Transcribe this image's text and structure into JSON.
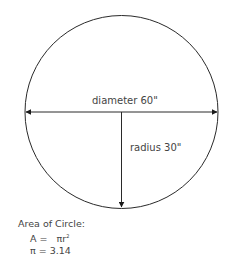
{
  "diagram": {
    "shape": "circle",
    "diameter_label": "diameter 60\"",
    "radius_label": "radius 30\"",
    "stroke_color": "#2a2a2a"
  },
  "formula": {
    "title": "Area of Circle:",
    "area_lhs": "A =",
    "area_rhs": "πr",
    "area_exponent": "2",
    "pi_line": "π = 3.14"
  }
}
